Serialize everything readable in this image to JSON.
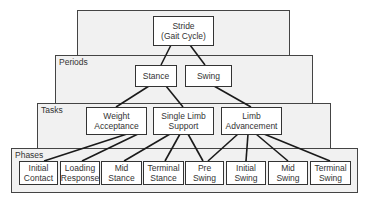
{
  "diagram": {
    "type": "hierarchy",
    "levels": [
      {
        "label": "",
        "nodes": [
          "Stride\n(Gait Cycle)"
        ]
      },
      {
        "label": "Periods",
        "nodes": [
          "Stance",
          "Swing"
        ]
      },
      {
        "label": "Tasks",
        "nodes": [
          "Weight\nAcceptance",
          "Single Limb\nSupport",
          "Limb\nAdvancement"
        ]
      },
      {
        "label": "Phases",
        "nodes": [
          "Initial\nContact",
          "Loading\nResponse",
          "Mid\nStance",
          "Terminal\nStance",
          "Pre\nSwing",
          "Initial\nSwing",
          "Mid\nSwing",
          "Terminal\nSwing"
        ]
      }
    ],
    "edges": [
      [
        "Stride (Gait Cycle)",
        "Stance"
      ],
      [
        "Stride (Gait Cycle)",
        "Swing"
      ],
      [
        "Stance",
        "Weight Acceptance"
      ],
      [
        "Stance",
        "Single Limb Support"
      ],
      [
        "Swing",
        "Limb Advancement"
      ],
      [
        "Weight Acceptance",
        "Initial Contact"
      ],
      [
        "Weight Acceptance",
        "Loading Response"
      ],
      [
        "Single Limb Support",
        "Mid Stance"
      ],
      [
        "Single Limb Support",
        "Terminal Stance"
      ],
      [
        "Single Limb Support",
        "Pre Swing"
      ],
      [
        "Limb Advancement",
        "Pre Swing"
      ],
      [
        "Limb Advancement",
        "Initial Swing"
      ],
      [
        "Limb Advancement",
        "Mid Swing"
      ],
      [
        "Limb Advancement",
        "Terminal Swing"
      ]
    ]
  },
  "bands": {
    "periods_label": "Periods",
    "tasks_label": "Tasks",
    "phases_label": "Phases"
  },
  "nodes": {
    "stride": "Stride\n(Gait Cycle)",
    "stance": "Stance",
    "swing": "Swing",
    "weight_acceptance": "Weight\nAcceptance",
    "single_limb_support": "Single Limb\nSupport",
    "limb_advancement": "Limb\nAdvancement",
    "initial_contact": "Initial\nContact",
    "loading_response": "Loading\nResponse",
    "mid_stance": "Mid\nStance",
    "terminal_stance": "Terminal\nStance",
    "pre_swing": "Pre\nSwing",
    "initial_swing": "Initial\nSwing",
    "mid_swing": "Mid\nSwing",
    "terminal_swing": "Terminal\nSwing"
  },
  "colors": {
    "band_fill": "#f1f1f1",
    "node_fill": "#ffffff",
    "line": "#1a1a1a"
  }
}
